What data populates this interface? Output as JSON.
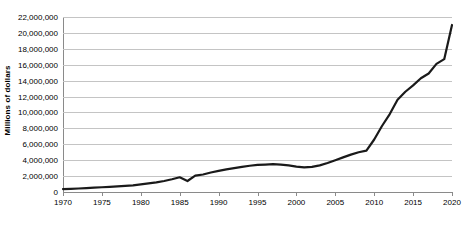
{
  "chart_data": {
    "type": "line",
    "title": "",
    "xlabel": "",
    "ylabel": "Millions of dollars",
    "xlim": [
      1970,
      2020
    ],
    "ylim": [
      0,
      22000000
    ],
    "grid": true,
    "legend": false,
    "legend_position": "none",
    "x_tick_labels": [
      "1970",
      "1975",
      "1980",
      "1985",
      "1990",
      "1995",
      "2000",
      "2005",
      "2010",
      "2015",
      "2020"
    ],
    "x_ticks": [
      1970,
      1975,
      1980,
      1985,
      1990,
      1995,
      2000,
      2005,
      2010,
      2015,
      2020
    ],
    "y_tick_labels": [
      "0",
      "2,000,000",
      "4,000,000",
      "6,000,000",
      "8,000,000",
      "10,000,000",
      "12,000,000",
      "14,000,000",
      "16,000,000",
      "18,000,000",
      "20,000,000",
      "22,000,000"
    ],
    "y_ticks": [
      0,
      2000000,
      4000000,
      6000000,
      8000000,
      10000000,
      12000000,
      14000000,
      16000000,
      18000000,
      20000000,
      22000000
    ],
    "line_color": "#1a1a1a",
    "grid_color": "#c4c4c4",
    "axis_color": "#8a8a8a",
    "background_color": "#ffffff",
    "x": [
      1970,
      1971,
      1972,
      1973,
      1974,
      1975,
      1976,
      1977,
      1978,
      1979,
      1980,
      1981,
      1982,
      1983,
      1984,
      1985,
      1986,
      1987,
      1988,
      1989,
      1990,
      1991,
      1992,
      1993,
      1994,
      1995,
      1996,
      1997,
      1998,
      1999,
      2000,
      2001,
      2002,
      2003,
      2004,
      2005,
      2006,
      2007,
      2008,
      2009,
      2010,
      2011,
      2012,
      2013,
      2014,
      2015,
      2016,
      2017,
      2018,
      2019,
      2020
    ],
    "values": [
      370000,
      400000,
      440000,
      490000,
      550000,
      600000,
      650000,
      700000,
      760000,
      830000,
      950000,
      1080000,
      1200000,
      1380000,
      1600000,
      1850000,
      1380000,
      2050000,
      2200000,
      2450000,
      2650000,
      2850000,
      3000000,
      3150000,
      3300000,
      3400000,
      3450000,
      3500000,
      3450000,
      3350000,
      3200000,
      3100000,
      3150000,
      3350000,
      3650000,
      4000000,
      4350000,
      4700000,
      5000000,
      5200000,
      6600000,
      8300000,
      9800000,
      11600000,
      12600000,
      13400000,
      14300000,
      14900000,
      16100000,
      16700000,
      21000000
    ]
  }
}
